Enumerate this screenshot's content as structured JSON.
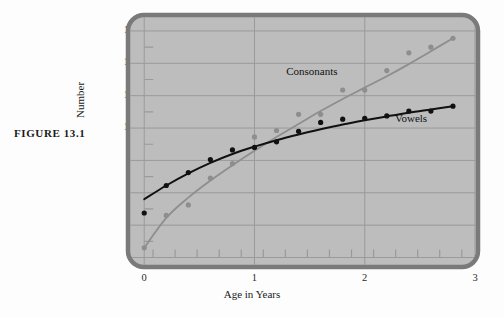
{
  "figure": {
    "caption": "FIGURE  13.1"
  },
  "colors": {
    "page_background": "#fdfdfd",
    "panel_background": "#bdbdbd",
    "panel_border": "#7a7a7a",
    "gridline": "#9a9a9a",
    "vowels_series": "#111111",
    "consonants_series": "#8e8e8e",
    "tick_label": "#2a2a2a"
  },
  "chart_data": {
    "type": "scatter",
    "title": "",
    "subtitle": "",
    "xlabel": "Age in Years",
    "ylabel": "Number",
    "xlim": [
      -0.12,
      3.0
    ],
    "ylim": [
      1.6,
      16.8
    ],
    "xticks": [
      0,
      1,
      2,
      3
    ],
    "xtick_labels": [
      "0",
      "1",
      "2",
      "3"
    ],
    "x_minor_tick_step": 0.2,
    "yticks": [
      2,
      4,
      6,
      8,
      10,
      12,
      14,
      16
    ],
    "ytick_labels": [
      "2",
      "4",
      "6",
      "8",
      "10",
      "12",
      "14",
      "16"
    ],
    "y_minor_ticks": [
      3,
      5,
      7,
      9,
      11,
      13,
      15
    ],
    "grid": true,
    "grid_axis": "both",
    "legend": "inline-annotations",
    "annotations": [
      {
        "text": "Consonants",
        "x": 1.52,
        "y": 13.3
      },
      {
        "text": "Vowels",
        "x": 2.42,
        "y": 10.4
      }
    ],
    "series": [
      {
        "name": "Vowels",
        "color": "#111111",
        "marker": "filled-circle",
        "points": [
          {
            "x": 0.0,
            "y": 4.75
          },
          {
            "x": 0.2,
            "y": 6.45
          },
          {
            "x": 0.4,
            "y": 7.25
          },
          {
            "x": 0.6,
            "y": 8.05
          },
          {
            "x": 0.8,
            "y": 8.65
          },
          {
            "x": 1.0,
            "y": 8.8
          },
          {
            "x": 1.2,
            "y": 9.15
          },
          {
            "x": 1.4,
            "y": 9.8
          },
          {
            "x": 1.6,
            "y": 10.35
          },
          {
            "x": 1.8,
            "y": 10.55
          },
          {
            "x": 2.0,
            "y": 10.6
          },
          {
            "x": 2.2,
            "y": 10.75
          },
          {
            "x": 2.4,
            "y": 11.05
          },
          {
            "x": 2.6,
            "y": 11.05
          },
          {
            "x": 2.8,
            "y": 11.35
          }
        ],
        "fit_curve": [
          {
            "x": 0.0,
            "y": 5.6
          },
          {
            "x": 0.2,
            "y": 6.45
          },
          {
            "x": 0.4,
            "y": 7.2
          },
          {
            "x": 0.6,
            "y": 7.85
          },
          {
            "x": 0.8,
            "y": 8.4
          },
          {
            "x": 1.0,
            "y": 8.85
          },
          {
            "x": 1.2,
            "y": 9.25
          },
          {
            "x": 1.4,
            "y": 9.6
          },
          {
            "x": 1.6,
            "y": 9.92
          },
          {
            "x": 1.8,
            "y": 10.22
          },
          {
            "x": 2.0,
            "y": 10.48
          },
          {
            "x": 2.2,
            "y": 10.72
          },
          {
            "x": 2.4,
            "y": 10.95
          },
          {
            "x": 2.6,
            "y": 11.15
          },
          {
            "x": 2.8,
            "y": 11.35
          }
        ]
      },
      {
        "name": "Consonants",
        "color": "#8e8e8e",
        "marker": "filled-circle",
        "points": [
          {
            "x": 0.0,
            "y": 2.6
          },
          {
            "x": 0.2,
            "y": 4.6
          },
          {
            "x": 0.4,
            "y": 5.25
          },
          {
            "x": 0.6,
            "y": 6.9
          },
          {
            "x": 0.8,
            "y": 7.8
          },
          {
            "x": 1.0,
            "y": 9.45
          },
          {
            "x": 1.2,
            "y": 9.85
          },
          {
            "x": 1.4,
            "y": 10.85
          },
          {
            "x": 1.6,
            "y": 10.85
          },
          {
            "x": 1.8,
            "y": 12.35
          },
          {
            "x": 2.0,
            "y": 12.35
          },
          {
            "x": 2.2,
            "y": 13.55
          },
          {
            "x": 2.4,
            "y": 14.65
          },
          {
            "x": 2.6,
            "y": 15.0
          },
          {
            "x": 2.8,
            "y": 15.55
          }
        ],
        "fit_curve": [
          {
            "x": 0.0,
            "y": 2.6
          },
          {
            "x": 0.2,
            "y": 4.45
          },
          {
            "x": 0.4,
            "y": 5.7
          },
          {
            "x": 0.6,
            "y": 6.75
          },
          {
            "x": 0.8,
            "y": 7.7
          },
          {
            "x": 1.0,
            "y": 8.6
          },
          {
            "x": 1.2,
            "y": 9.45
          },
          {
            "x": 1.4,
            "y": 10.25
          },
          {
            "x": 1.6,
            "y": 11.05
          },
          {
            "x": 1.8,
            "y": 11.8
          },
          {
            "x": 2.0,
            "y": 12.5
          },
          {
            "x": 2.2,
            "y": 13.2
          },
          {
            "x": 2.4,
            "y": 13.95
          },
          {
            "x": 2.6,
            "y": 14.75
          },
          {
            "x": 2.8,
            "y": 15.55
          }
        ]
      }
    ]
  }
}
